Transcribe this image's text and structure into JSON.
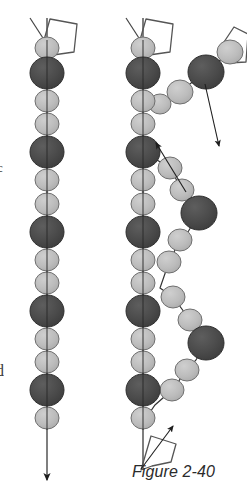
{
  "figure": {
    "caption": "Figure 2-40",
    "background_color": "#ffffff",
    "edge_text_fragments": [
      {
        "name": "left-edge-fragment-upper",
        "text": "c"
      },
      {
        "name": "left-edge-fragment-lower",
        "text": "d"
      }
    ],
    "palette": {
      "dark_bead_fill": "#4a4a4a",
      "dark_bead_stroke": "#2e2e2e",
      "light_bead_fill": "#b9b9b9",
      "light_bead_stroke": "#6f6f6f",
      "line_stroke": "#333333",
      "outline_stroke": "#555555",
      "caption_color": "#2b2b2b"
    },
    "panels": [
      {
        "name": "left-panel",
        "label": "relaxed-chain",
        "description": "Single straight vertical bead chain with pentagon tag at top and downward arrow at bottom",
        "axis_x": 47,
        "axis_top": 18,
        "axis_bottom": 486,
        "arrow_direction": "down",
        "beads": [
          {
            "type": "light",
            "cx": 47,
            "cy": 48,
            "r": 11
          },
          {
            "type": "dark",
            "cx": 47,
            "cy": 73,
            "r": 16
          },
          {
            "type": "light",
            "cx": 47,
            "cy": 101,
            "r": 11
          },
          {
            "type": "light",
            "cx": 47,
            "cy": 124,
            "r": 11
          },
          {
            "type": "dark",
            "cx": 47,
            "cy": 152,
            "r": 16
          },
          {
            "type": "light",
            "cx": 47,
            "cy": 180,
            "r": 11
          },
          {
            "type": "light",
            "cx": 47,
            "cy": 204,
            "r": 11
          },
          {
            "type": "dark",
            "cx": 47,
            "cy": 232,
            "r": 16
          },
          {
            "type": "light",
            "cx": 47,
            "cy": 260,
            "r": 11
          },
          {
            "type": "light",
            "cx": 47,
            "cy": 283,
            "r": 11
          },
          {
            "type": "dark",
            "cx": 47,
            "cy": 311,
            "r": 16
          },
          {
            "type": "light",
            "cx": 47,
            "cy": 339,
            "r": 11
          },
          {
            "type": "light",
            "cx": 47,
            "cy": 362,
            "r": 11
          },
          {
            "type": "dark",
            "cx": 47,
            "cy": 390,
            "r": 16
          },
          {
            "type": "light",
            "cx": 47,
            "cy": 418,
            "r": 11
          },
          {
            "type": "light",
            "cx": 47,
            "cy": 441,
            "r": 11
          }
        ],
        "pentagon_tags": [
          {
            "name": "pentagon-tag-top-left",
            "points": "44,40 50,19 77,24 74,52 53,55"
          }
        ]
      },
      {
        "name": "right-panel",
        "label": "branched-chain",
        "description": "Vertical bead chain with a second chain branching out to the right, two pentagon tags and three arrows",
        "axis_x": 143,
        "axis_top": 18,
        "axis_bottom": 470,
        "beads_main": [
          {
            "type": "light",
            "cx": 143,
            "cy": 48,
            "r": 11
          },
          {
            "type": "dark",
            "cx": 143,
            "cy": 73,
            "r": 16
          },
          {
            "type": "light",
            "cx": 143,
            "cy": 101,
            "r": 11
          },
          {
            "type": "light",
            "cx": 143,
            "cy": 124,
            "r": 11
          },
          {
            "type": "dark",
            "cx": 143,
            "cy": 152,
            "r": 16
          },
          {
            "type": "light",
            "cx": 143,
            "cy": 180,
            "r": 11
          },
          {
            "type": "light",
            "cx": 143,
            "cy": 204,
            "r": 11
          },
          {
            "type": "dark",
            "cx": 143,
            "cy": 232,
            "r": 16
          },
          {
            "type": "light",
            "cx": 143,
            "cy": 260,
            "r": 11
          },
          {
            "type": "light",
            "cx": 143,
            "cy": 283,
            "r": 11
          },
          {
            "type": "dark",
            "cx": 143,
            "cy": 311,
            "r": 16
          },
          {
            "type": "light",
            "cx": 143,
            "cy": 339,
            "r": 11
          },
          {
            "type": "light",
            "cx": 143,
            "cy": 362,
            "r": 11
          },
          {
            "type": "dark",
            "cx": 143,
            "cy": 390,
            "r": 16
          },
          {
            "type": "light",
            "cx": 143,
            "cy": 418,
            "r": 11
          }
        ],
        "beads_branch": [
          {
            "type": "light",
            "cx": 160,
            "cy": 104,
            "r": 10
          },
          {
            "type": "light",
            "cx": 179,
            "cy": 92,
            "r": 12
          },
          {
            "type": "dark",
            "cx": 206,
            "cy": 72,
            "r": 17
          },
          {
            "type": "light",
            "cx": 229,
            "cy": 53,
            "r": 12
          },
          {
            "type": "light",
            "cx": 170,
            "cy": 168,
            "r": 11
          },
          {
            "type": "light",
            "cx": 182,
            "cy": 190,
            "r": 11
          },
          {
            "type": "dark",
            "cx": 199,
            "cy": 213,
            "r": 17
          },
          {
            "type": "light",
            "cx": 180,
            "cy": 240,
            "r": 11
          },
          {
            "type": "light",
            "cx": 169,
            "cy": 262,
            "r": 11
          },
          {
            "type": "light",
            "cx": 173,
            "cy": 297,
            "r": 11
          },
          {
            "type": "light",
            "cx": 190,
            "cy": 320,
            "r": 11
          },
          {
            "type": "dark",
            "cx": 206,
            "cy": 343,
            "r": 17
          },
          {
            "type": "light",
            "cx": 187,
            "cy": 370,
            "r": 11
          },
          {
            "type": "light",
            "cx": 172,
            "cy": 390,
            "r": 11
          }
        ],
        "pentagon_tags": [
          {
            "name": "pentagon-tag-top-right",
            "points": "140,40 146,19 173,24 170,52 149,55"
          },
          {
            "name": "pentagon-tag-side-right",
            "points": "224,42 232,28 247,35 245,62 228,63"
          },
          {
            "name": "pentagon-tag-bottom-right",
            "points": "141,470 150,437 175,443 172,462 152,465"
          }
        ],
        "arrows": [
          {
            "name": "arrow-down-right",
            "x1": 207,
            "y1": 86,
            "x2": 218,
            "y2": 143,
            "direction": "down-right"
          },
          {
            "name": "arrow-up-left",
            "x1": 185,
            "y1": 190,
            "x2": 157,
            "y2": 144,
            "direction": "up-left"
          },
          {
            "name": "arrow-up-right",
            "x1": 143,
            "y1": 468,
            "x2": 172,
            "y2": 427,
            "direction": "up-right"
          }
        ]
      }
    ]
  }
}
